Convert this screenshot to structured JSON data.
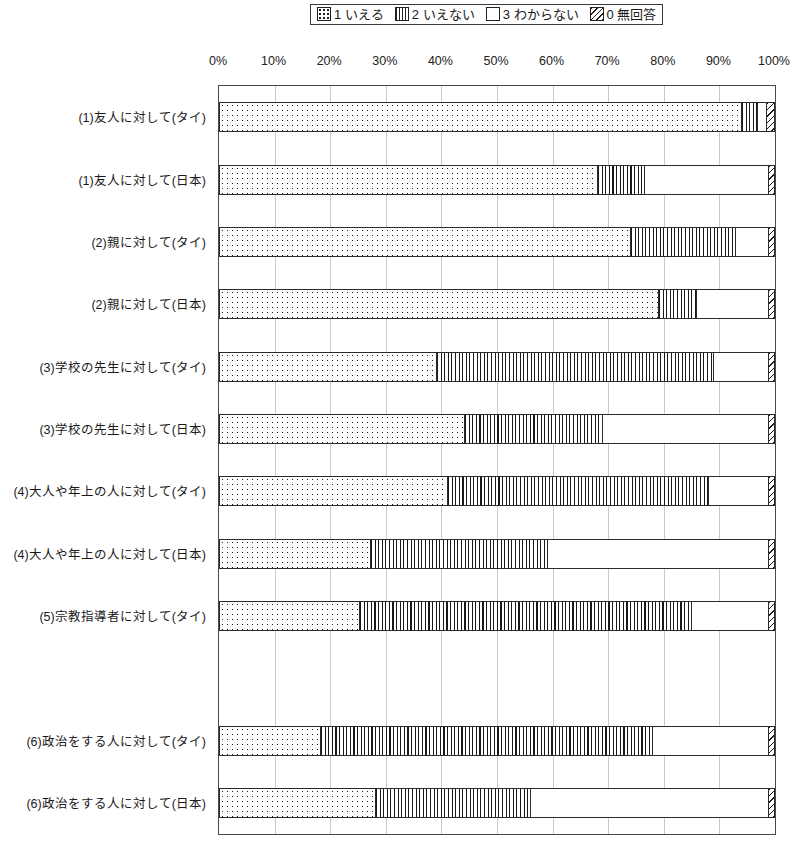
{
  "legend": {
    "position": "top-center",
    "items": [
      {
        "key": "1",
        "label": "1 いえる",
        "pattern": "dots"
      },
      {
        "key": "2",
        "label": "2 いえない",
        "pattern": "vertical-lines"
      },
      {
        "key": "3",
        "label": "3 わからない",
        "pattern": "white"
      },
      {
        "key": "0",
        "label": "0 無回答",
        "pattern": "diagonal-hatch"
      }
    ]
  },
  "axis": {
    "x_ticks": [
      "0%",
      "10%",
      "20%",
      "30%",
      "40%",
      "50%",
      "60%",
      "70%",
      "80%",
      "90%",
      "100%"
    ],
    "x_min": 0,
    "x_max": 100,
    "grid": true
  },
  "chart_data": {
    "type": "bar",
    "orientation": "horizontal",
    "stacked": true,
    "stack_total": 100,
    "title": "",
    "xlabel": "",
    "ylabel": "",
    "xlim": [
      0,
      100
    ],
    "legend_position": "top",
    "series": [
      {
        "name": "1 いえる",
        "pattern": "dots",
        "values": [
          94.0,
          68.0,
          74.0,
          79.0,
          39.0,
          44.0,
          41.0,
          27.0,
          25.0,
          null,
          18.0,
          28.0
        ]
      },
      {
        "name": "2 いえない",
        "pattern": "vertical-lines",
        "values": [
          3.0,
          8.5,
          19.0,
          7.0,
          50.0,
          25.0,
          47.0,
          32.0,
          60.0,
          null,
          60.0,
          28.0
        ]
      },
      {
        "name": "3 わからない",
        "pattern": "white",
        "values": [
          1.5,
          22.5,
          6.0,
          13.0,
          10.0,
          30.0,
          11.0,
          40.0,
          14.0,
          null,
          21.0,
          43.0
        ]
      },
      {
        "name": "0 無回答",
        "pattern": "diagonal-hatch",
        "values": [
          1.5,
          1.0,
          1.0,
          1.0,
          1.0,
          1.0,
          1.0,
          1.0,
          1.0,
          null,
          1.0,
          1.0
        ]
      }
    ],
    "categories": [
      "(1)友人に対して(タイ)",
      "(1)友人に対して(日本)",
      "(2)親に対して(タイ)",
      "(2)親に対して(日本)",
      "(3)学校の先生に対して(タイ)",
      "(3)学校の先生に対して(日本)",
      "(4)大人や年上の人に対して(タイ)",
      "(4)大人や年上の人に対して(日本)",
      "(5)宗教指導者に対して(タイ)",
      "",
      "(6)政治をする人に対して(タイ)",
      "(6)政治をする人に対して(日本)"
    ]
  },
  "colors": {
    "ink": "#1a1a1a",
    "frame": "#4a4a4a",
    "grid": "#c9c9c9",
    "background": "#ffffff"
  }
}
